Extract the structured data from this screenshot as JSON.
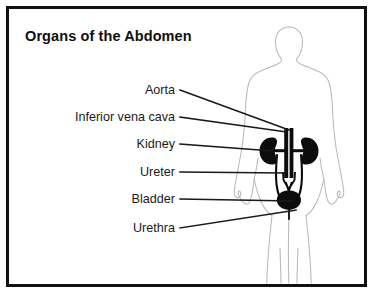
{
  "figure": {
    "title": "Organs of the Abdomen",
    "colors": {
      "background": "#ffffff",
      "frame": "#111111",
      "body_outline": "#b9b9b9",
      "organ_fill": "#0c0c0c",
      "leader_line": "#1a1a1a",
      "text": "#1a1a1a"
    }
  },
  "labels": [
    {
      "id": "aorta",
      "text": "Aorta",
      "x": 175,
      "y": 90,
      "tip_x": 289,
      "tip_y": 131
    },
    {
      "id": "inferior-vena-cava",
      "text": "Inferior vena cava",
      "x": 175,
      "y": 117,
      "tip_x": 286,
      "tip_y": 133
    },
    {
      "id": "kidney",
      "text": "Kidney",
      "x": 175,
      "y": 144,
      "tip_x": 276,
      "tip_y": 151
    },
    {
      "id": "ureter",
      "text": "Ureter",
      "x": 175,
      "y": 172,
      "tip_x": 285,
      "tip_y": 174
    },
    {
      "id": "bladder",
      "text": "Bladder",
      "x": 175,
      "y": 199,
      "tip_x": 291,
      "tip_y": 202
    },
    {
      "id": "urethra",
      "text": "Urethra",
      "x": 175,
      "y": 228,
      "tip_x": 295,
      "tip_y": 210
    }
  ],
  "organs": [
    {
      "id": "left-kidney",
      "name": "kidney"
    },
    {
      "id": "right-kidney",
      "name": "kidney"
    },
    {
      "id": "aorta-vessel",
      "name": "aorta"
    },
    {
      "id": "vena-cava-vessel",
      "name": "inferior-vena-cava"
    },
    {
      "id": "ureter-left",
      "name": "ureter"
    },
    {
      "id": "ureter-right",
      "name": "ureter"
    },
    {
      "id": "bladder-organ",
      "name": "bladder"
    },
    {
      "id": "urethra-tube",
      "name": "urethra"
    }
  ]
}
